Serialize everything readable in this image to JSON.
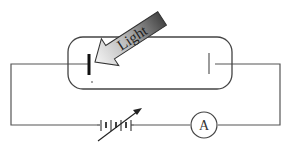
{
  "diagram": {
    "light_arrow": {
      "label": "Light",
      "gradient_start": "#f2f2f2",
      "gradient_end": "#4a4a4a"
    },
    "tube": {
      "description": "evacuated tube with cathode and anode"
    },
    "cathode": {
      "name": "emitter plate"
    },
    "anode": {
      "name": "collector plate"
    },
    "battery": {
      "type": "variable voltage source"
    },
    "ammeter": {
      "label": "A"
    },
    "colors": {
      "wire": "#555555",
      "plate": "#111111",
      "background": "#ffffff"
    }
  }
}
